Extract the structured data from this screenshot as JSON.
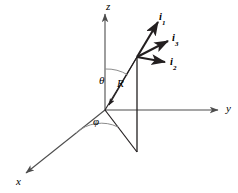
{
  "figure": {
    "kind": "spherical-coordinate-diagram",
    "background_color": "#ffffff",
    "stroke_color": "#231f20",
    "axis_color": "#4d4d4d"
  },
  "axes": [
    {
      "name": "x-axis",
      "label": "x",
      "label_x": 16,
      "label_y": 176,
      "direction": "lower-left"
    },
    {
      "name": "y-axis",
      "label": "y",
      "label_x": 226,
      "label_y": 103,
      "direction": "right"
    },
    {
      "name": "z-axis",
      "label": "z",
      "label_x": 106,
      "label_y": 1,
      "direction": "up"
    }
  ],
  "angles": [
    {
      "name": "theta",
      "label": "θ",
      "label_x": 99,
      "label_y": 75,
      "from": "z-axis",
      "to": "R"
    },
    {
      "name": "phi",
      "label": "φ",
      "label_x": 93,
      "label_y": 116,
      "from": "x-axis",
      "to": "projection"
    }
  ],
  "radial_vector": {
    "label": "R",
    "label_x": 117,
    "label_y": 78,
    "origin": {
      "x": 105,
      "y": 110
    },
    "tip": {
      "x": 137,
      "y": 57
    }
  },
  "unit_vectors": [
    {
      "name": "i1",
      "base": "i",
      "subscript": "1",
      "label_x": 159,
      "label_y": 12,
      "tip_x": 158,
      "tip_y": 22
    },
    {
      "name": "i3",
      "base": "i",
      "subscript": "3",
      "label_x": 172,
      "label_y": 33,
      "tip_x": 168,
      "tip_y": 41
    },
    {
      "name": "i2",
      "base": "i",
      "subscript": "2",
      "label_x": 170,
      "label_y": 57,
      "tip_x": 165,
      "tip_y": 62
    }
  ]
}
